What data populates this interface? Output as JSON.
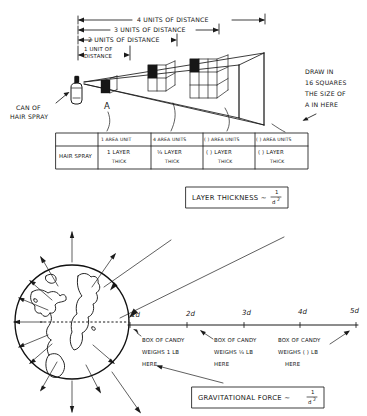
{
  "figure": {
    "title_top": "Inverse square law: hair spray cone",
    "title_bottom": "Inverse square law: gravitational force"
  },
  "top_diagram": {
    "distance_labels": [
      "4 UNITS OF DISTANCE",
      "3 UNITS OF DISTANCE",
      "2 UNITS OF DISTANCE",
      "1 UNIT OF",
      "DISTANCE"
    ],
    "source_label_line1": "CAN OF",
    "source_label_line2": "HAIR SPRAY",
    "square_label": "A",
    "instruction": [
      "DRAW IN",
      "16 SQUARES",
      "THE SIZE OF",
      "A IN HERE"
    ],
    "table": {
      "row_header": "HAIR SPRAY",
      "area_row": [
        "1 AREA UNIT",
        "4 AREA UNITS",
        "(     ) AREA UNITS",
        "(     ) AREA UNITS"
      ],
      "thickness_row": [
        {
          "amount": "1 LAYER",
          "sub": "THICK"
        },
        {
          "amount": "¼ LAYER",
          "sub": "THICK"
        },
        {
          "amount": "(     ) LAYER",
          "sub": "THICK"
        },
        {
          "amount": "(     ) LAYER",
          "sub": "THICK"
        }
      ]
    },
    "formula": {
      "text": "LAYER THICKNESS ~",
      "numerator": "1",
      "denominator": "d",
      "exponent": "2"
    }
  },
  "bottom_diagram": {
    "tick_labels": [
      "1d",
      "2d",
      "3d",
      "4d",
      "5d"
    ],
    "candy_labels": [
      {
        "l1": "BOX OF CANDY",
        "l2": "WEIGHS 1 LB",
        "l3": "HERE"
      },
      {
        "l1": "BOX OF CANDY",
        "l2": "WEIGHS ¼ LB",
        "l3": "HERE"
      },
      {
        "l1": "BOX OF CANDY",
        "l2": "WEIGHS (   ) LB",
        "l3": "HERE"
      }
    ],
    "formula": {
      "text": "GRAVITATIONAL FORCE ~",
      "numerator": "1",
      "denominator": "d",
      "exponent": "2"
    }
  },
  "colors": {
    "ink": "#1b1b1b",
    "paper": "#ffffff"
  }
}
